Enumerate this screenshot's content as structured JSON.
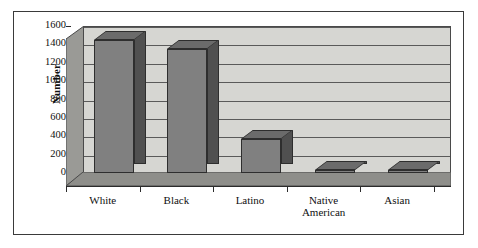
{
  "chart_data": {
    "type": "bar",
    "title": "",
    "subtitle": "",
    "xlabel": "",
    "ylabel": "Number",
    "categories": [
      "White",
      "Black",
      "Latino",
      "Native American",
      "Asian"
    ],
    "category_lines": [
      [
        "White"
      ],
      [
        "Black"
      ],
      [
        "Latino"
      ],
      [
        "Native",
        "American"
      ],
      [
        "Asian"
      ]
    ],
    "values": [
      1450,
      1350,
      370,
      35,
      30
    ],
    "ylim": [
      0,
      1600
    ],
    "ytick_values": [
      0,
      200,
      400,
      600,
      800,
      1000,
      1200,
      1400,
      1600
    ],
    "ytick_labels": [
      "0",
      "200",
      "400",
      "600",
      "800",
      "1000",
      "1200",
      "1400",
      "1600"
    ],
    "grid": true,
    "legend": false,
    "style": "3d-column",
    "series": [
      {
        "name": "Number",
        "values": [
          1450,
          1350,
          370,
          35,
          30
        ]
      }
    ]
  },
  "colors": {
    "bar_front": "#808080",
    "bar_side": "#505050",
    "bar_top": "#6b6b6b",
    "back_wall": "#d6d6d2",
    "side_wall": "#9a9a96",
    "floor": "#8e8e8a",
    "gridline": "#5a5a5a",
    "axis": "#2b2b2b",
    "border": "#3a3a3a",
    "text": "#101010",
    "background": "#ffffff"
  }
}
